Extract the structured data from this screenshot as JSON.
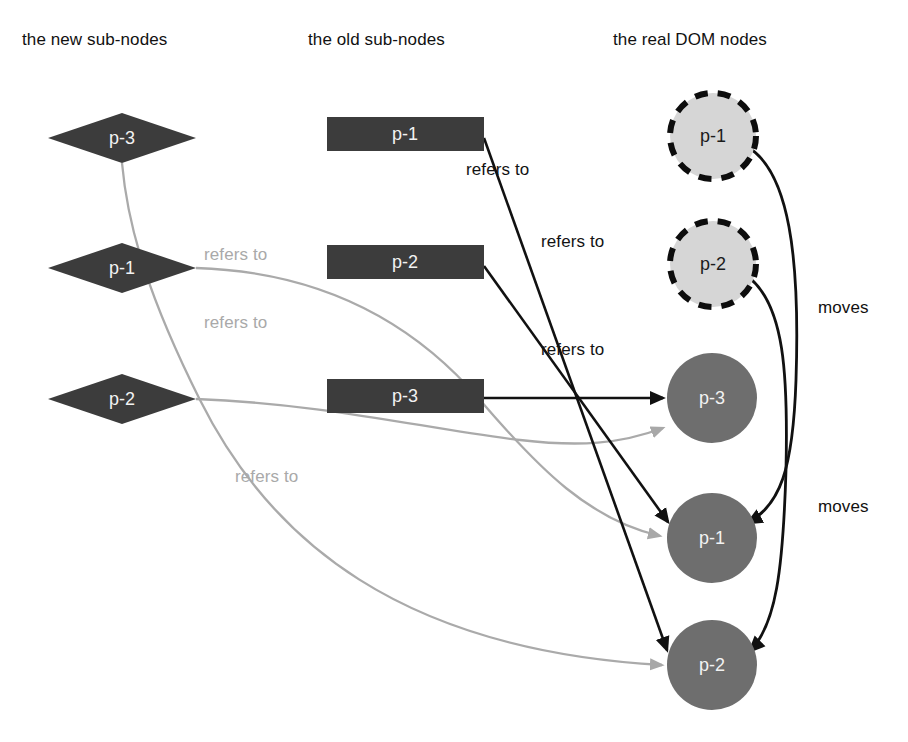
{
  "diagram": {
    "background": "#ffffff",
    "columns": [
      {
        "id": "new-sub-nodes",
        "label": "the new sub-nodes",
        "x": 22,
        "y": 30
      },
      {
        "id": "old-sub-nodes",
        "label": "the old sub-nodes",
        "x": 308,
        "y": 30
      },
      {
        "id": "real-dom-nodes",
        "label": "the real DOM nodes",
        "x": 613,
        "y": 30
      }
    ],
    "colors": {
      "diamond_fill": "#3c3c3c",
      "diamond_text": "#f2f2f2",
      "rect_fill": "#3c3c3c",
      "rect_text": "#f2f2f2",
      "dashed_circle_fill": "#d6d6d6",
      "dashed_circle_stroke": "#0d0d0d",
      "dashed_circle_text": "#1b1b1b",
      "solid_circle_fill": "#6e6e6e",
      "solid_circle_text": "#f4f4f4",
      "black_edge": "#111111",
      "gray_edge": "#aaaaaa",
      "label_black": "#131313",
      "label_gray": "#a9a9a9"
    },
    "nodes": {
      "new_sub_nodes": [
        {
          "id": "new-p3",
          "label": "p-3",
          "shape": "diamond",
          "cx": 122,
          "cy": 138,
          "rx": 74,
          "ry": 25
        },
        {
          "id": "new-p1",
          "label": "p-1",
          "shape": "diamond",
          "cx": 122,
          "cy": 268,
          "rx": 74,
          "ry": 25
        },
        {
          "id": "new-p2",
          "label": "p-2",
          "shape": "diamond",
          "cx": 122,
          "cy": 399,
          "rx": 74,
          "ry": 25
        }
      ],
      "old_sub_nodes": [
        {
          "id": "old-p1",
          "label": "p-1",
          "shape": "rect",
          "x": 327,
          "y": 117,
          "w": 157,
          "h": 34
        },
        {
          "id": "old-p2",
          "label": "p-2",
          "shape": "rect",
          "x": 327,
          "y": 245,
          "w": 157,
          "h": 34
        },
        {
          "id": "old-p3",
          "label": "p-3",
          "shape": "rect",
          "x": 327,
          "y": 379,
          "w": 157,
          "h": 34
        }
      ],
      "real_dom_nodes": [
        {
          "id": "dom-old-p1",
          "label": "p-1",
          "shape": "circle-dashed",
          "cx": 713,
          "cy": 136,
          "r": 43
        },
        {
          "id": "dom-old-p2",
          "label": "p-2",
          "shape": "circle-dashed",
          "cx": 713,
          "cy": 264,
          "r": 43
        },
        {
          "id": "dom-p3",
          "label": "p-3",
          "shape": "circle-solid",
          "cx": 712,
          "cy": 398,
          "r": 45
        },
        {
          "id": "dom-p1",
          "label": "p-1",
          "shape": "circle-solid",
          "cx": 712,
          "cy": 538,
          "r": 45
        },
        {
          "id": "dom-p2",
          "label": "p-2",
          "shape": "circle-solid",
          "cx": 712,
          "cy": 665,
          "r": 45
        }
      ]
    },
    "edges": [
      {
        "id": "edge-new-p3-to-dom-p2",
        "kind": "gray",
        "from": "new-p3",
        "to": "dom-p2",
        "label": ""
      },
      {
        "id": "edge-new-p1-to-dom-p1",
        "kind": "gray",
        "from": "new-p1",
        "to": "dom-p1",
        "label": "refers to"
      },
      {
        "id": "edge-new-p2-to-dom-p3",
        "kind": "gray",
        "from": "new-p2",
        "to": "dom-p3",
        "label": "refers to"
      },
      {
        "id": "edge-old-p1-to-dom-p2",
        "kind": "black",
        "from": "old-p1",
        "to": "dom-p2",
        "label": "refers to"
      },
      {
        "id": "edge-old-p2-to-dom-p1",
        "kind": "black",
        "from": "old-p2",
        "to": "dom-p1",
        "label": "refers to"
      },
      {
        "id": "edge-old-p3-to-dom-p3",
        "kind": "black",
        "from": "old-p3",
        "to": "dom-p3",
        "label": "refers to"
      },
      {
        "id": "edge-move-p1",
        "kind": "black",
        "from": "dom-old-p1",
        "to": "dom-p1",
        "label": "moves"
      },
      {
        "id": "edge-move-p2",
        "kind": "black",
        "from": "dom-old-p2",
        "to": "dom-p2",
        "label": "moves"
      }
    ],
    "edge_labels": [
      {
        "id": "label-refers-to-gray-1",
        "text": "refers to",
        "tone": "gray",
        "x": 204,
        "y": 245
      },
      {
        "id": "label-refers-to-gray-2",
        "text": "refers to",
        "tone": "gray",
        "x": 204,
        "y": 313
      },
      {
        "id": "label-refers-to-gray-3",
        "text": "refers to",
        "tone": "gray",
        "x": 235,
        "y": 467
      },
      {
        "id": "label-refers-to-black-1",
        "text": "refers to",
        "tone": "black",
        "x": 466,
        "y": 160
      },
      {
        "id": "label-refers-to-black-2",
        "text": "refers to",
        "tone": "black",
        "x": 541,
        "y": 232
      },
      {
        "id": "label-refers-to-black-3",
        "text": "refers to",
        "tone": "black",
        "x": 541,
        "y": 340
      },
      {
        "id": "label-moves-1",
        "text": "moves",
        "tone": "moves",
        "x": 818,
        "y": 298
      },
      {
        "id": "label-moves-2",
        "text": "moves",
        "tone": "moves",
        "x": 818,
        "y": 497
      }
    ]
  }
}
